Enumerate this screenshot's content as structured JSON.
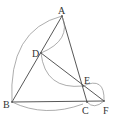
{
  "figure": {
    "colors": {
      "line": "#444444",
      "arc": "#8a8a8a",
      "label": "#333333",
      "background": "#ffffff"
    },
    "points": {
      "A": {
        "label": "A",
        "x": 62,
        "y": 16
      },
      "B": {
        "label": "B",
        "x": 12,
        "y": 102
      },
      "C": {
        "label": "C",
        "x": 87,
        "y": 102
      },
      "D": {
        "label": "D",
        "x": 41,
        "y": 53
      },
      "E": {
        "label": "E",
        "x": 83,
        "y": 86
      },
      "F": {
        "label": "F",
        "x": 104,
        "y": 101
      }
    },
    "segments": [
      "AB",
      "AC",
      "BC",
      "CF",
      "DF"
    ],
    "arcs": [
      "BA",
      "DA",
      "DE",
      "EF",
      "BC",
      "CF"
    ]
  }
}
